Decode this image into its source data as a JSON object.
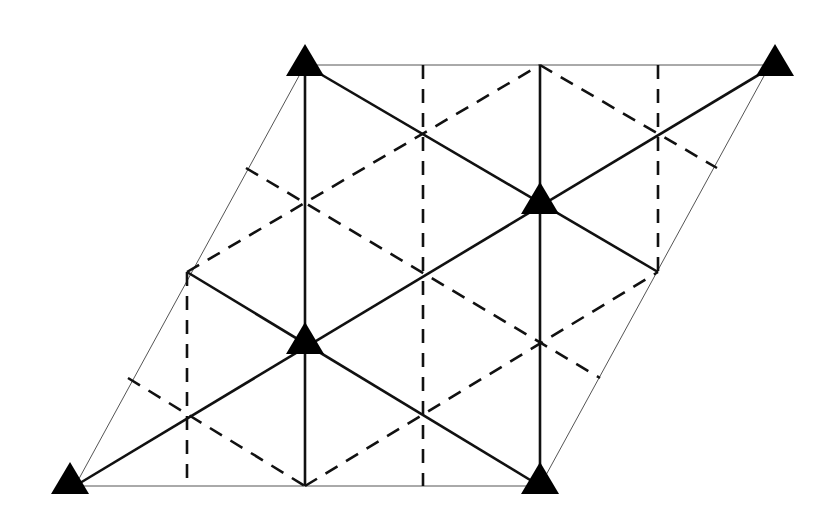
{
  "diagram": {
    "type": "rhombic lattice unit cell",
    "colors": {
      "background": "#ffffff",
      "line": "#111111",
      "frame": "#555555",
      "marker": "#000000"
    },
    "frame": {
      "points": [
        [
          305,
          65
        ],
        [
          770,
          65
        ],
        [
          540,
          486
        ],
        [
          75,
          486
        ]
      ]
    },
    "markers": [
      {
        "shape": "triangle",
        "x": 305,
        "y": 62
      },
      {
        "shape": "triangle",
        "x": 775,
        "y": 62
      },
      {
        "shape": "triangle",
        "x": 540,
        "y": 200
      },
      {
        "shape": "triangle",
        "x": 305,
        "y": 340
      },
      {
        "shape": "triangle",
        "x": 70,
        "y": 480
      },
      {
        "shape": "triangle",
        "x": 540,
        "y": 480
      }
    ],
    "solid_lines": [
      [
        305,
        65,
        305,
        486
      ],
      [
        540,
        65,
        540,
        486
      ],
      [
        305,
        65,
        658,
        272
      ],
      [
        75,
        486,
        775,
        65
      ],
      [
        187,
        272,
        540,
        486
      ]
    ],
    "dashed_lines": [
      [
        187,
        272,
        187,
        486
      ],
      [
        423,
        65,
        423,
        486
      ],
      [
        658,
        65,
        658,
        272
      ],
      [
        246,
        168,
        600,
        378
      ],
      [
        128,
        378,
        305,
        486
      ],
      [
        187,
        272,
        540,
        65
      ],
      [
        305,
        486,
        658,
        272
      ],
      [
        540,
        65,
        717,
        168
      ]
    ],
    "intersections": [
      [
        423,
        133
      ],
      [
        658,
        133
      ],
      [
        305,
        203
      ],
      [
        423,
        273
      ],
      [
        540,
        343
      ],
      [
        187,
        413
      ],
      [
        423,
        413
      ]
    ]
  }
}
